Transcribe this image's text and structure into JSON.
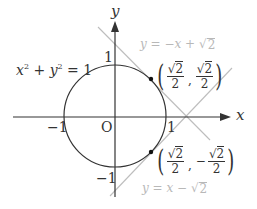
{
  "diagram": {
    "colors": {
      "axis": "#333333",
      "circle": "#333333",
      "tangent_lines": "#bdbdbd",
      "tangent_labels": "#b8b8b8",
      "points": "#111111"
    },
    "axes": {
      "x_label": "x",
      "y_label": "y",
      "origin_label": "O",
      "ticks": {
        "x_pos": "1",
        "x_neg": "−1",
        "y_pos": "1",
        "y_neg": "−1"
      }
    },
    "circle": {
      "equation_lhs_x": "x",
      "equation_exp": "2",
      "equation_plus": " + ",
      "equation_lhs_y": "y",
      "equation_rhs": " = 1"
    },
    "lines": [
      {
        "name": "tangent-upper",
        "prefix": "y = −x + ",
        "radicand": "2"
      },
      {
        "name": "tangent-lower",
        "prefix": "y = x − ",
        "radicand": "2"
      }
    ],
    "points": [
      {
        "num": "2",
        "den": "2",
        "x_sign": "",
        "y_sign": "",
        "comma": ",",
        "open": "(",
        "close": ")"
      },
      {
        "num": "2",
        "den": "2",
        "x_sign": "",
        "y_sign": "−",
        "comma": ",",
        "open": "(",
        "close": ")"
      }
    ],
    "sqrt_symbol": "√"
  }
}
